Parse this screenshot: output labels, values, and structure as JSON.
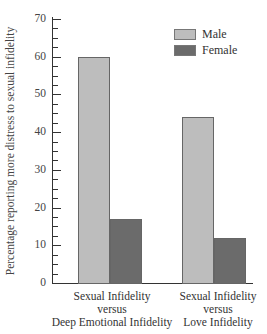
{
  "chart_data": {
    "type": "bar",
    "title": "",
    "xlabel": "",
    "ylabel": "Percentage reporting more distress to sexual infidelity",
    "ylim": [
      0,
      70
    ],
    "yticks": [
      0,
      10,
      20,
      30,
      40,
      50,
      60,
      70
    ],
    "grid": false,
    "legend_position": "top-right",
    "categories": [
      "Sexual Infidelity versus Deep Emotional Infidelity",
      "Sexual Infidelity versus Love Infidelity"
    ],
    "category_lines": [
      [
        "Sexual Infidelity",
        "versus",
        "Deep Emotional Infidelity"
      ],
      [
        "Sexual Infidelity",
        "versus",
        "Love Infidelity"
      ]
    ],
    "series": [
      {
        "name": "Male",
        "color": "#bdbdbd",
        "values": [
          60,
          44
        ]
      },
      {
        "name": "Female",
        "color": "#6b6b6b",
        "values": [
          17,
          12
        ]
      }
    ]
  },
  "legend": {
    "male": "Male",
    "female": "Female"
  },
  "axis": {
    "y_ticks": [
      "0",
      "10",
      "20",
      "30",
      "40",
      "50",
      "60",
      "70"
    ]
  }
}
